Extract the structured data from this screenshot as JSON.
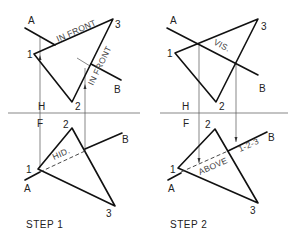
{
  "diagram": {
    "type": "descriptive-geometry-visibility",
    "steps": [
      {
        "id": "step1",
        "caption": "STEP 1",
        "top_view": {
          "fold_labels": {
            "upper": "H"
          },
          "points": {
            "p1": "1",
            "p2": "2",
            "p3": "3"
          },
          "line_labels": {
            "a": "A",
            "b": "B"
          },
          "annotations": [
            "IN FRONT",
            "IN FRONT"
          ]
        },
        "front_view": {
          "fold_labels": {
            "lower": "F"
          },
          "points": {
            "p1": "1",
            "p2": "2",
            "p3": "3"
          },
          "line_labels": {
            "a": "A",
            "b": "B"
          },
          "annotations": [
            "HID."
          ]
        }
      },
      {
        "id": "step2",
        "caption": "STEP 2",
        "top_view": {
          "fold_labels": {
            "upper": "H"
          },
          "points": {
            "p1": "1",
            "p2": "2",
            "p3": "3"
          },
          "line_labels": {
            "a": "A",
            "b": "B"
          },
          "annotations": [
            "VIS."
          ]
        },
        "front_view": {
          "fold_labels": {
            "lower": "F"
          },
          "points": {
            "p1": "1",
            "p2": "2",
            "p3": "3"
          },
          "line_labels": {
            "a": "A",
            "b": "B"
          },
          "annotations": [
            "ABOVE",
            "1-2-3"
          ]
        }
      }
    ]
  }
}
